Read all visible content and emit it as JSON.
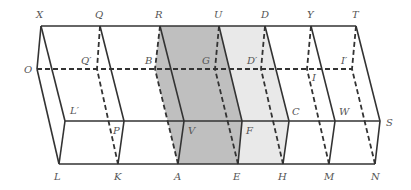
{
  "diagram": {
    "colors": {
      "line": "#333333",
      "dark_fill": "#bfbfbf",
      "light_fill": "#e9e9e9",
      "label": "#555555"
    },
    "labels": {
      "X": "X",
      "Q": "Q",
      "R": "R",
      "U": "U",
      "D": "D",
      "Y": "Y",
      "T": "T",
      "O": "O",
      "Q_prime": "Q′",
      "B": "B",
      "G": "G",
      "D_prime": "D′",
      "I": "I",
      "I_prime": "I′",
      "L_prime": "L′",
      "P": "P",
      "V": "V",
      "F": "F",
      "C": "C",
      "W": "W",
      "S": "S",
      "L": "L",
      "K": "K",
      "A": "A",
      "E": "E",
      "H": "H",
      "M": "M",
      "N": "N"
    }
  }
}
